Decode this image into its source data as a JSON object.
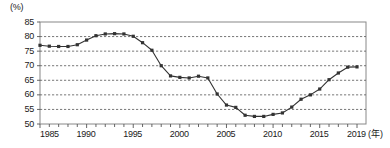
{
  "chart_data": {
    "type": "line",
    "title": "",
    "subtitle": "",
    "xlabel": "(年)",
    "ylabel": "(%)",
    "xlim": [
      1985,
      2019
    ],
    "ylim": [
      50,
      85
    ],
    "y_ticks": [
      50,
      55,
      60,
      65,
      70,
      75,
      80,
      85
    ],
    "x_ticks": [
      1985,
      1990,
      1995,
      2000,
      2005,
      2010,
      2015,
      2019
    ],
    "x_tick_labels": [
      "1985",
      "1990",
      "1995",
      "2000",
      "2005",
      "2010",
      "2015",
      "2019"
    ],
    "grid": "horizontal-dashed",
    "legend": "none",
    "marker": "square",
    "series_color": "#333333",
    "grid_color": "#555555",
    "axis_color": "#888888",
    "x": [
      1985,
      1986,
      1987,
      1988,
      1989,
      1990,
      1991,
      1992,
      1993,
      1994,
      1995,
      1996,
      1997,
      1998,
      1999,
      2000,
      2001,
      2002,
      2003,
      2004,
      2005,
      2006,
      2007,
      2008,
      2009,
      2010,
      2011,
      2012,
      2013,
      2014,
      2015,
      2016,
      2017,
      2018,
      2019
    ],
    "values": [
      77.0,
      76.7,
      76.6,
      76.6,
      77.2,
      78.8,
      80.3,
      80.9,
      81.0,
      80.9,
      80.1,
      77.9,
      75.3,
      70.0,
      66.5,
      66.0,
      65.8,
      66.4,
      65.8,
      60.3,
      56.5,
      55.7,
      53.0,
      52.6,
      52.6,
      53.3,
      53.8,
      55.8,
      58.5,
      60.0,
      62.0,
      65.2,
      67.5,
      69.5,
      69.6
    ],
    "annotations": []
  },
  "axis": {
    "y_unit": "(%)",
    "x_unit": "(年)"
  }
}
